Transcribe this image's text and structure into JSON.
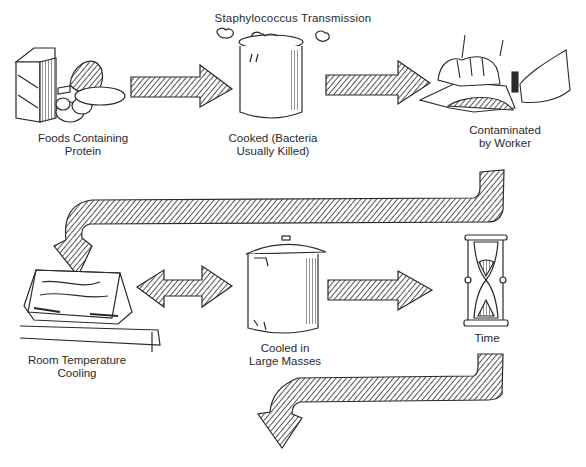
{
  "title": "Staphylococcus Transmission",
  "steps": [
    {
      "id": "foods",
      "label": "Foods Containing\nProtein",
      "icon": "milk-carton-ham-eggs"
    },
    {
      "id": "cooked",
      "label": "Cooked (Bacteria\nUsually Killed)",
      "icon": "steaming-pot"
    },
    {
      "id": "contaminated",
      "label": "Contaminated\nby Worker",
      "icon": "hands-slicing-food"
    },
    {
      "id": "room-temp",
      "label": "Room Temperature\nCooling",
      "icon": "baking-pan-on-table"
    },
    {
      "id": "large-masses",
      "label": "Cooled in\nLarge Masses",
      "icon": "large-stock-pot"
    },
    {
      "id": "time",
      "label": "Time",
      "icon": "hourglass"
    }
  ],
  "arrows": [
    {
      "from": "foods",
      "to": "cooked",
      "type": "right"
    },
    {
      "from": "cooked",
      "to": "contaminated",
      "type": "right"
    },
    {
      "from": "contaminated",
      "to": "room-temp",
      "type": "bent-down-left"
    },
    {
      "from": "room-temp",
      "to": "large-masses",
      "type": "double-headed"
    },
    {
      "from": "large-masses",
      "to": "time",
      "type": "right"
    },
    {
      "from": "time",
      "to": "next",
      "type": "bent-down-left"
    }
  ],
  "colors": {
    "ink": "#2a2a2a",
    "paper": "#ffffff"
  }
}
